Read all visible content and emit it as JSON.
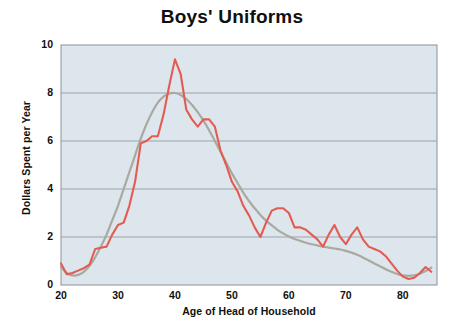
{
  "chart_data": {
    "type": "line",
    "title": "Boys' Uniforms",
    "xlabel": "Age of Head of Household",
    "ylabel": "Dollars Spent per Year",
    "xlim": [
      20,
      86
    ],
    "ylim": [
      0,
      10
    ],
    "xticks": [
      20,
      30,
      40,
      50,
      60,
      70,
      80
    ],
    "yticks": [
      0,
      2,
      4,
      6,
      8,
      10
    ],
    "grid": "horizontal",
    "legend": "none",
    "plot_background": "#dde6ec",
    "series": [
      {
        "name": "raw",
        "color": "#e35b52",
        "style": "jagged-line",
        "x": [
          20,
          21,
          22,
          23,
          24,
          25,
          26,
          27,
          28,
          29,
          30,
          31,
          32,
          33,
          34,
          35,
          36,
          37,
          38,
          39,
          40,
          41,
          42,
          43,
          44,
          45,
          46,
          47,
          48,
          49,
          50,
          51,
          52,
          53,
          54,
          55,
          56,
          57,
          58,
          59,
          60,
          61,
          62,
          63,
          64,
          65,
          66,
          67,
          68,
          69,
          70,
          71,
          72,
          73,
          74,
          75,
          76,
          77,
          78,
          79,
          80,
          81,
          82,
          83,
          84,
          85
        ],
        "values": [
          0.9,
          0.45,
          0.5,
          0.6,
          0.7,
          0.85,
          1.5,
          1.55,
          1.6,
          2.1,
          2.5,
          2.6,
          3.3,
          4.3,
          5.9,
          6.0,
          6.2,
          6.2,
          7.1,
          8.3,
          9.4,
          8.8,
          7.3,
          6.9,
          6.6,
          6.9,
          6.9,
          6.6,
          5.6,
          5.0,
          4.3,
          3.9,
          3.3,
          2.9,
          2.4,
          2.0,
          2.6,
          3.1,
          3.2,
          3.2,
          3.0,
          2.4,
          2.4,
          2.3,
          2.1,
          1.9,
          1.6,
          2.1,
          2.5,
          2.0,
          1.7,
          2.1,
          2.4,
          1.9,
          1.6,
          1.5,
          1.4,
          1.2,
          0.9,
          0.6,
          0.35,
          0.25,
          0.3,
          0.5,
          0.75,
          0.55
        ]
      },
      {
        "name": "smooth",
        "color": "#a9a9a1",
        "style": "smooth-line",
        "x": [
          20,
          21,
          22,
          23,
          24,
          25,
          26,
          27,
          28,
          29,
          30,
          31,
          32,
          33,
          34,
          35,
          36,
          37,
          38,
          39,
          40,
          41,
          42,
          43,
          44,
          45,
          46,
          47,
          48,
          49,
          50,
          51,
          52,
          53,
          54,
          55,
          56,
          57,
          58,
          59,
          60,
          61,
          62,
          63,
          64,
          65,
          66,
          67,
          68,
          69,
          70,
          71,
          72,
          73,
          74,
          75,
          76,
          77,
          78,
          79,
          80,
          81,
          82,
          83,
          84,
          85
        ],
        "values": [
          0.75,
          0.5,
          0.4,
          0.42,
          0.55,
          0.8,
          1.15,
          1.6,
          2.1,
          2.7,
          3.3,
          4.0,
          4.7,
          5.4,
          6.1,
          6.7,
          7.2,
          7.6,
          7.85,
          7.98,
          8.0,
          7.92,
          7.75,
          7.5,
          7.2,
          6.85,
          6.45,
          6.0,
          5.55,
          5.1,
          4.65,
          4.25,
          3.85,
          3.5,
          3.2,
          2.92,
          2.68,
          2.48,
          2.3,
          2.15,
          2.02,
          1.92,
          1.84,
          1.76,
          1.7,
          1.65,
          1.6,
          1.56,
          1.52,
          1.48,
          1.42,
          1.35,
          1.26,
          1.15,
          1.02,
          0.9,
          0.78,
          0.66,
          0.55,
          0.46,
          0.4,
          0.38,
          0.4,
          0.47,
          0.58,
          0.72
        ]
      }
    ]
  }
}
